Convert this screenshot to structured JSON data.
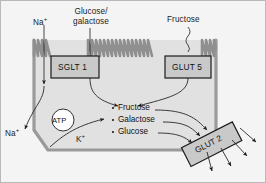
{
  "diagram": {
    "colors": {
      "background": "#f4f4f4",
      "cell_fill": "#e3e3e3",
      "membrane": "#9a9a9a",
      "microvilli": "#8f8f8f",
      "box_fill": "#c9c9c9",
      "box_stroke": "#1c1c1c",
      "arrow": "#1c1c1c",
      "text": "#111111",
      "atp_fill": "#ffffff"
    },
    "apical_labels": [
      {
        "id": "sodium-apical",
        "text": "Na",
        "sup": "+"
      },
      {
        "id": "glucose-galactose",
        "line1": "Glucose/",
        "line2": "galactose"
      },
      {
        "id": "fructose-apical",
        "text": "Fructose"
      }
    ],
    "transporters": [
      {
        "id": "sglt1",
        "label": "SGLT 1"
      },
      {
        "id": "glut5",
        "label": "GLUT 5"
      },
      {
        "id": "glut2",
        "label": "GLUT 2"
      }
    ],
    "cytosol_list": [
      {
        "id": "cyto-fructose",
        "label": "Fructose"
      },
      {
        "id": "cyto-galactose",
        "label": "Galactose"
      },
      {
        "id": "cyto-glucose",
        "label": "Glucose"
      }
    ],
    "pump": {
      "id": "na-k-atpase",
      "label": "ATP",
      "out_label": "Na",
      "out_sup": "+",
      "in_label": "K",
      "in_sup": "+"
    }
  }
}
